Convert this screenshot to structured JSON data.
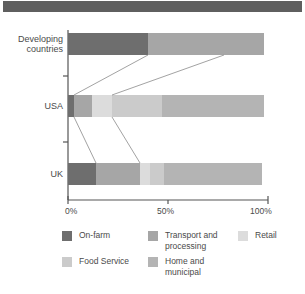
{
  "figure": {
    "banner_color": "#5f5f5f",
    "background": "#ffffff"
  },
  "chart_data": {
    "type": "bar",
    "orientation": "horizontal",
    "stacked": true,
    "normalized": true,
    "title": "",
    "subtitle": "",
    "xlabel": "",
    "ylabel": "",
    "xlim": [
      0,
      100
    ],
    "grid": false,
    "legend_position": "bottom",
    "categories": [
      "Developing countries",
      "USA",
      "UK"
    ],
    "category_label_lines": [
      [
        "Developing",
        "countries"
      ],
      [
        "USA"
      ],
      [
        "UK"
      ]
    ],
    "xticks": [
      0,
      50,
      100
    ],
    "xticklabels": [
      "0%",
      "50%",
      "100%"
    ],
    "series": [
      {
        "name": "On-farm",
        "color": "#6e6e6e",
        "values": [
          40,
          3,
          14
        ]
      },
      {
        "name": "Transport and\nprocessing",
        "color": "#a6a6a6",
        "values": [
          58,
          9,
          22
        ]
      },
      {
        "name": "Retail",
        "color": "#dcdcdc",
        "values": [
          0,
          10,
          5
        ]
      },
      {
        "name": "Food Service",
        "color": "#cbcbcb",
        "values": [
          0,
          25,
          7
        ]
      },
      {
        "name": "Home and\nmunicipal",
        "color": "#b4b4b4",
        "values": [
          0,
          51,
          49
        ]
      }
    ],
    "leader_lines": [
      {
        "from_category": "USA",
        "from_value": 3,
        "to_category": "Developing countries",
        "to_value": 40
      },
      {
        "from_category": "USA",
        "from_value": 22,
        "to_category": "Developing countries",
        "to_value": 78
      },
      {
        "from_category": "USA",
        "from_value": 3,
        "to_category": "UK",
        "to_value": 14
      },
      {
        "from_category": "USA",
        "from_value": 22,
        "to_category": "UK",
        "to_value": 36
      }
    ]
  },
  "legend": {
    "items": [
      {
        "label": "On-farm",
        "color": "#6e6e6e"
      },
      {
        "label": "Transport and\nprocessing",
        "color": "#a6a6a6"
      },
      {
        "label": "Retail",
        "color": "#dcdcdc"
      },
      {
        "label": "Food Service",
        "color": "#cbcbcb"
      },
      {
        "label": "Home and\nmunicipal",
        "color": "#b4b4b4"
      }
    ]
  }
}
